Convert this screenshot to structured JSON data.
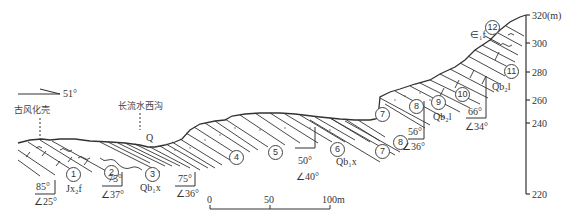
{
  "diagram": {
    "type": "geological-cross-section",
    "orientation": {
      "label": "51°"
    },
    "place_labels": {
      "paleo_weathering_crust": "古风化壳",
      "stream_valley": "长流水西沟",
      "quaternary": "Q",
      "cambrian_top": "∈₁f"
    },
    "layers": [
      {
        "id": "1",
        "symbol": "①"
      },
      {
        "id": "2",
        "symbol": "②"
      },
      {
        "id": "3",
        "symbol": "③"
      },
      {
        "id": "4",
        "symbol": "④"
      },
      {
        "id": "5",
        "symbol": "⑤"
      },
      {
        "id": "6",
        "symbol": "⑥"
      },
      {
        "id": "7a",
        "symbol": "⑦"
      },
      {
        "id": "7b",
        "symbol": "⑦"
      },
      {
        "id": "8a",
        "symbol": "⑧"
      },
      {
        "id": "8b",
        "symbol": "⑧"
      },
      {
        "id": "9",
        "symbol": "⑨"
      },
      {
        "id": "10",
        "symbol": "⑩"
      },
      {
        "id": "11",
        "symbol": "⑪"
      },
      {
        "id": "12",
        "symbol": "⑫"
      }
    ],
    "formations": {
      "jx2": "Jx₂f",
      "qb1x_a": "Qb₁x",
      "qb1x_b": "Qb₁x",
      "qb2l_a": "Qb₂l",
      "qb2l_b": "Qb₂l"
    },
    "attitudes": [
      {
        "dip_dir": "85°",
        "dip": "∠25°"
      },
      {
        "dip_dir": "75°",
        "dip": "∠37°"
      },
      {
        "dip_dir": "75°",
        "dip": "∠36°"
      },
      {
        "dip_dir": "50°",
        "dip": "∠40°"
      },
      {
        "dip_dir": "56°",
        "dip": "∠36°"
      },
      {
        "dip_dir": "66°",
        "dip": "∠34°"
      }
    ],
    "elevation_axis": {
      "unit": "(m)",
      "ticks": [
        "320",
        "300",
        "280",
        "260",
        "240",
        "220"
      ]
    },
    "scale_bar": {
      "ticks": [
        "0",
        "50",
        "100m"
      ]
    }
  }
}
